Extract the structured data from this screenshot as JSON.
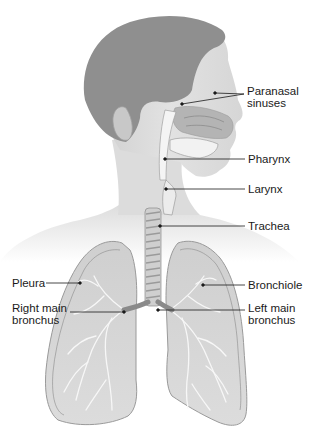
{
  "diagram": {
    "type": "anatomical-illustration",
    "colors": {
      "background": "#ffffff",
      "hair": "#8f8f8f",
      "skin": "#d9d9d9",
      "skin_light": "#ebebeb",
      "airway": "#f4f4f4",
      "lung_fill": "#d2d2d2",
      "lung_outline": "#9a9a9a",
      "leader_line": "#1a1a1a",
      "text": "#1a1a1a"
    },
    "labels": [
      {
        "id": "paranasal-sinuses",
        "text": "Paranasal\nsinuses",
        "side": "right"
      },
      {
        "id": "pharynx",
        "text": "Pharynx",
        "side": "right"
      },
      {
        "id": "larynx",
        "text": "Larynx",
        "side": "right"
      },
      {
        "id": "trachea",
        "text": "Trachea",
        "side": "right"
      },
      {
        "id": "bronchiole",
        "text": "Bronchiole",
        "side": "right"
      },
      {
        "id": "left-main-bronchus",
        "text": "Left main\nbronchus",
        "side": "right"
      },
      {
        "id": "pleura",
        "text": "Pleura",
        "side": "left"
      },
      {
        "id": "right-main-bronchus",
        "text": "Right main\nbronchus",
        "side": "left"
      }
    ]
  }
}
